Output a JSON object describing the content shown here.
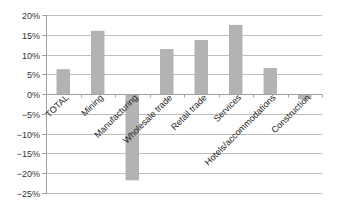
{
  "chart_data": {
    "type": "bar",
    "title": "",
    "xlabel": "",
    "ylabel": "",
    "categories": [
      "TOTAL",
      "Mining",
      "Manufacturing",
      "Wholesale trade",
      "Retail trade",
      "Services",
      "Hotels/accommodations",
      "Construction"
    ],
    "values": [
      6.3,
      16.0,
      -21.8,
      11.4,
      13.7,
      17.5,
      6.6,
      -1.3
    ],
    "ylim": [
      -25,
      20
    ],
    "yticks": [
      20,
      15,
      10,
      5,
      0,
      -5,
      -10,
      -15,
      -20,
      -25
    ],
    "ytick_labels": [
      "20%",
      "15%",
      "10%",
      "5%",
      "0%",
      "−5%",
      "−10%",
      "−15%",
      "−20%",
      "−25%"
    ],
    "grid": true,
    "legend": "none",
    "bar_color": "#b3b3b3"
  }
}
